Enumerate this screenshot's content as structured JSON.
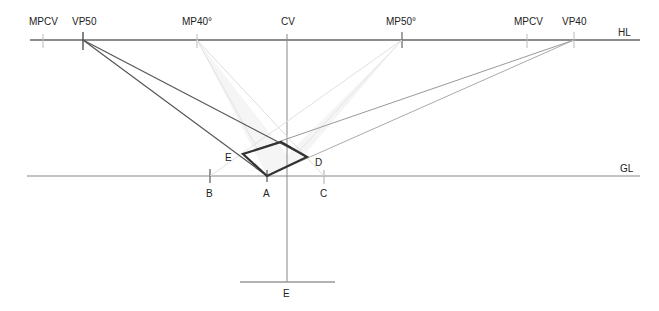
{
  "diagram": {
    "colors": {
      "background": "#ffffff",
      "horizon": "#666666",
      "dark_lines": "#555555",
      "medium_lines": "#9a9a9a",
      "light_lines": "#dcdcdc",
      "square": "#333333",
      "shading": "#f2f2f2"
    },
    "horizon_line": {
      "label": "HL",
      "y": 40
    },
    "ground_line": {
      "label": "GL",
      "y": 176
    },
    "points": {
      "mpcv_left": {
        "label": "MPCV",
        "x": 43
      },
      "vp50": {
        "label": "VP50",
        "x": 83
      },
      "mp40": {
        "label": "MP40°",
        "x": 197
      },
      "cv": {
        "label": "CV",
        "x": 287
      },
      "mp50": {
        "label": "MP50°",
        "x": 402
      },
      "mpcv_right": {
        "label": "MPCV",
        "x": 527
      },
      "vp40": {
        "label": "VP40",
        "x": 574
      }
    },
    "ground_marks": {
      "B": {
        "label": "B",
        "x": 210
      },
      "A": {
        "label": "A",
        "x": 267
      },
      "C": {
        "label": "C",
        "x": 324
      }
    },
    "square_labels": {
      "E": "E",
      "D": "D"
    },
    "station_point": {
      "label": "E"
    }
  }
}
